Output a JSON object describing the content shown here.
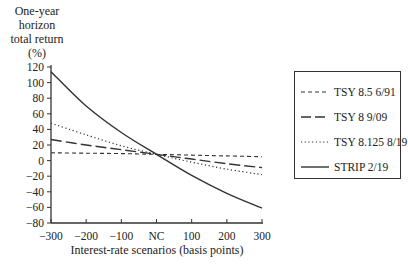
{
  "chart_data": {
    "type": "line",
    "title": "",
    "ylabel": "One-year horizon total return (%)",
    "ylabel_lines": [
      "One-year",
      "horizon",
      "total return",
      "(%)"
    ],
    "xlabel": "Interest-rate scenarios (basis points)",
    "x": [
      -300,
      -200,
      -100,
      0,
      100,
      200,
      300
    ],
    "x_tick_labels": [
      "−300",
      "−200",
      "−100",
      "NC",
      "100",
      "200",
      "300"
    ],
    "y_ticks": [
      120,
      100,
      80,
      60,
      40,
      20,
      0,
      -20,
      -40,
      -60,
      -80
    ],
    "y_tick_labels": [
      "120",
      "100",
      "80",
      "60",
      "40",
      "20",
      "0",
      "−20",
      "−40",
      "−60",
      "−80"
    ],
    "ylim": [
      -80,
      120
    ],
    "xlim": [
      -300,
      300
    ],
    "grid": false,
    "legend_position": "right",
    "series": [
      {
        "name": "TSY 8.5 6/91",
        "style": "short-dash",
        "values": [
          10,
          9.5,
          9,
          8,
          7,
          6,
          5
        ]
      },
      {
        "name": "TSY 8 9/09",
        "style": "long-dash",
        "values": [
          27,
          20,
          14,
          8,
          2,
          -4,
          -9
        ]
      },
      {
        "name": "TSY 8.125 8/19",
        "style": "dotted",
        "values": [
          48,
          33,
          19,
          8,
          -2,
          -11,
          -18
        ]
      },
      {
        "name": "STRIP 2/19",
        "style": "solid",
        "values": [
          114,
          70,
          36,
          8,
          -19,
          -42,
          -61
        ]
      }
    ]
  },
  "legend": {
    "items": [
      {
        "label": "TSY 8.5 6/91"
      },
      {
        "label": "TSY 8 9/09"
      },
      {
        "label": "TSY 8.125 8/19"
      },
      {
        "label": "STRIP 2/19"
      }
    ]
  }
}
